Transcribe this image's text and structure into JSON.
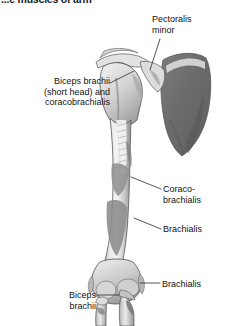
{
  "figure": {
    "title": "...e muscles of arm",
    "title_clipped": true,
    "background_color": "#ffffff",
    "colors": {
      "bone_light": "#ededed",
      "bone_mid": "#b9b9b9",
      "bone_shadow": "#8c8c8c",
      "scapula_dark": "#6f6f6f",
      "attachment_gray": "#9a9a9a",
      "outline": "#4a4a4a",
      "leader_line": "#2a2a2a",
      "text": "#111111"
    },
    "labels": [
      {
        "id": "pectoralis-minor",
        "text": "Pectoralis\nminor",
        "lines": [
          "Pectoralis",
          "minor"
        ],
        "position": "top-right",
        "leader": "diagonal line down-left to coracoid process"
      },
      {
        "id": "biceps-short-head",
        "text": "Biceps brachii\n(short head) and\ncoracobrachialis",
        "lines": [
          "Biceps brachii",
          "(short head) and",
          "coracobrachialis"
        ],
        "position": "upper-left",
        "leader": "diagonal line up-right to coracoid process"
      },
      {
        "id": "coracobrachialis",
        "text": "Coraco-\nbrachialis",
        "lines": [
          "Coraco-",
          "brachialis"
        ],
        "position": "mid-right",
        "leader": "short diagonal line down-left to humeral shaft"
      },
      {
        "id": "brachialis-mid",
        "text": "Brachialis",
        "lines": [
          "Brachialis"
        ],
        "position": "mid-right-lower",
        "leader": "short diagonal line down-left to distal humeral shaft"
      },
      {
        "id": "brachialis-low",
        "text": "Brachialis",
        "lines": [
          "Brachialis"
        ],
        "position": "lower-right",
        "leader": "short horizontal dash left to ulnar tuberosity"
      },
      {
        "id": "biceps-brachii",
        "text": "Biceps\nbrachii",
        "lines": [
          "Biceps",
          "brachii"
        ],
        "position": "bottom-left",
        "leader": "horizontal line right to radial tuberosity"
      }
    ]
  }
}
